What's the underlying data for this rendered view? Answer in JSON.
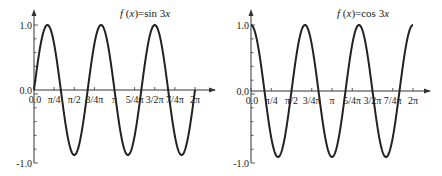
{
  "chart_data": [
    {
      "type": "line",
      "title": "f(x)=sin 3x",
      "title_parts": {
        "f": "f",
        "open": " (",
        "x": "x",
        "close": ")=sin 3",
        "x2": "x"
      },
      "function": "sin(3x)",
      "xlabel": "",
      "ylabel": "",
      "xlim": [
        0,
        6.2832
      ],
      "ylim": [
        -1.0,
        1.0
      ],
      "x_ticks": [
        "0.0",
        "π/4",
        "π/2",
        "3/4π",
        "π",
        "5/4π",
        "3/2π",
        "7/4π",
        "2π"
      ],
      "y_ticks": [
        "1.0",
        "0.0",
        "-1.0"
      ],
      "series": [
        {
          "name": "sin 3x",
          "color": "#222222",
          "x": [
            0,
            0.5236,
            1.0472,
            1.5708,
            2.0944,
            2.618,
            3.1416,
            3.6652,
            4.1888,
            4.7124,
            5.236,
            5.7596,
            6.2832
          ],
          "values": [
            0,
            1,
            0,
            -1,
            0,
            1,
            0,
            -1,
            0,
            1,
            0,
            -1,
            0
          ]
        }
      ],
      "grid": false,
      "legend": "none"
    },
    {
      "type": "line",
      "title": "f(x)=cos 3x",
      "title_parts": {
        "f": "f",
        "open": " (",
        "x": "x",
        "close": ")=cos 3",
        "x2": "x"
      },
      "function": "cos(3x)",
      "xlabel": "",
      "ylabel": "",
      "xlim": [
        0,
        6.2832
      ],
      "ylim": [
        -1.0,
        1.0
      ],
      "x_ticks": [
        "0.0",
        "π/4",
        "π/2",
        "3/4π",
        "π",
        "5/4π",
        "3/2π",
        "7/4π",
        "2π"
      ],
      "y_ticks": [
        "1.0",
        "0.0",
        "-1.0"
      ],
      "series": [
        {
          "name": "cos 3x",
          "color": "#222222",
          "x": [
            0,
            0.5236,
            1.0472,
            1.5708,
            2.0944,
            2.618,
            3.1416,
            3.6652,
            4.1888,
            4.7124,
            5.236,
            5.7596,
            6.2832
          ],
          "values": [
            1,
            0,
            -1,
            0,
            1,
            0,
            -1,
            0,
            1,
            0,
            -1,
            0,
            1
          ]
        }
      ],
      "grid": false,
      "legend": "none"
    }
  ]
}
